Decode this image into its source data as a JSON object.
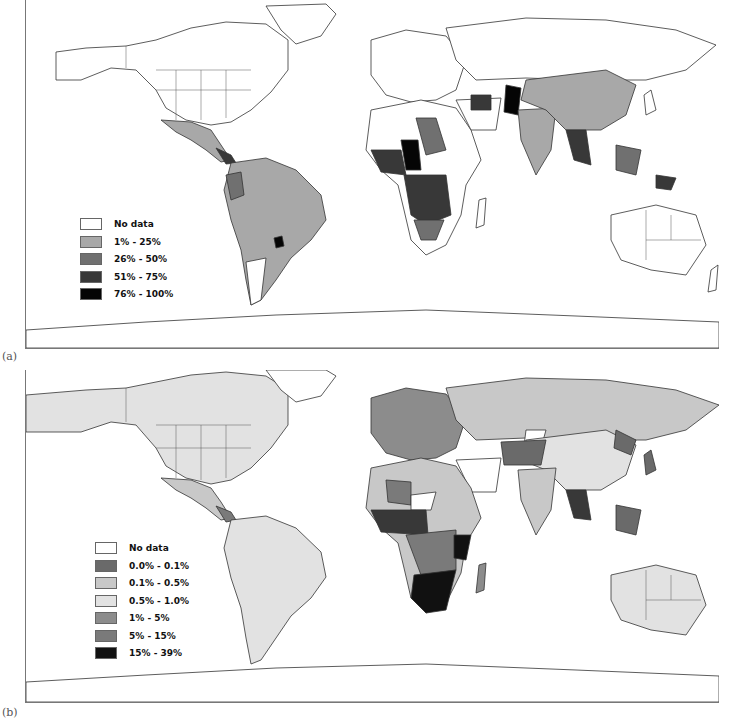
{
  "figure": {
    "panels": [
      {
        "id": "a",
        "label": "(a)",
        "legend": {
          "items": [
            {
              "label": "No data",
              "color": "#ffffff"
            },
            {
              "label": "1% - 25%",
              "color": "#a8a8a8"
            },
            {
              "label": "26% - 50%",
              "color": "#707070"
            },
            {
              "label": "51% - 75%",
              "color": "#383838"
            },
            {
              "label": "76% - 100%",
              "color": "#050505"
            }
          ]
        }
      },
      {
        "id": "b",
        "label": "(b)",
        "legend": {
          "items": [
            {
              "label": "No data",
              "color": "#ffffff"
            },
            {
              "label": "0.0% - 0.1%",
              "color": "#6a6a6a"
            },
            {
              "label": "0.1% - 0.5%",
              "color": "#c8c8c8"
            },
            {
              "label": "0.5% - 1.0%",
              "color": "#e2e2e2"
            },
            {
              "label": "1% - 5%",
              "color": "#8c8c8c"
            },
            {
              "label": "5% - 15%",
              "color": "#7a7a7a"
            },
            {
              "label": "15% - 39%",
              "color": "#111111"
            }
          ]
        }
      }
    ]
  }
}
